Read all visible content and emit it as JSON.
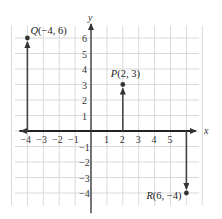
{
  "diagram": {
    "type": "coordinate-plane",
    "axes": {
      "x_label": "x",
      "y_label": "y",
      "x_ticks": [
        "-4",
        "-3",
        "-2",
        "-1",
        "1",
        "2",
        "3",
        "4",
        "5"
      ],
      "y_ticks": [
        "6",
        "5",
        "4",
        "3",
        "2",
        "1",
        "-1",
        "-2",
        "-3",
        "-4"
      ],
      "x_range": [
        -5,
        7
      ],
      "y_range": [
        -5,
        7
      ]
    },
    "points": [
      {
        "name": "Q",
        "x": -4,
        "y": 6,
        "label": "Q(−4, 6)"
      },
      {
        "name": "P",
        "x": 2,
        "y": 3,
        "label": "P(2, 3)"
      },
      {
        "name": "R",
        "x": 6,
        "y": -4,
        "label": "R(6, −4)"
      }
    ],
    "colors": {
      "grid": "#d9d9d9",
      "axis": "#333333",
      "point": "#333333",
      "arrow_x": "#555555"
    }
  }
}
